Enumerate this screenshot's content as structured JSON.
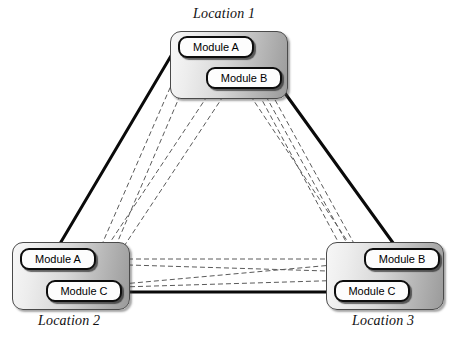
{
  "diagram": {
    "background": "#ffffff",
    "solid_link_color": "#0a0a0a",
    "dashed_link_color": "#5a5a5a",
    "module_fill": "#fdfdfd",
    "module_border": "#0d0d0d",
    "site_border": "#4a4a4a"
  },
  "sites": [
    {
      "id": "location-1",
      "label": "Location 1",
      "label_pos": {
        "x": 193,
        "y": 6
      },
      "box": {
        "x": 170,
        "y": 31,
        "w": 118,
        "h": 68
      },
      "modules": [
        {
          "id": "l1-module-a",
          "label": "Module A",
          "x": 178,
          "y": 36,
          "w": 76,
          "h": 22
        },
        {
          "id": "l1-module-b",
          "label": "Module B",
          "x": 206,
          "y": 67,
          "w": 76,
          "h": 22
        }
      ]
    },
    {
      "id": "location-2",
      "label": "Location 2",
      "label_pos": {
        "x": 38,
        "y": 313
      },
      "box": {
        "x": 12,
        "y": 242,
        "w": 118,
        "h": 68
      },
      "modules": [
        {
          "id": "l2-module-a",
          "label": "Module A",
          "x": 20,
          "y": 248,
          "w": 76,
          "h": 22
        },
        {
          "id": "l2-module-c",
          "label": "Module C",
          "x": 46,
          "y": 280,
          "w": 76,
          "h": 22
        }
      ]
    },
    {
      "id": "location-3",
      "label": "Location 3",
      "label_pos": {
        "x": 352,
        "y": 313
      },
      "box": {
        "x": 326,
        "y": 242,
        "w": 118,
        "h": 68
      },
      "modules": [
        {
          "id": "l3-module-b",
          "label": "Module B",
          "x": 364,
          "y": 248,
          "w": 76,
          "h": 22
        },
        {
          "id": "l3-module-c",
          "label": "Module C",
          "x": 334,
          "y": 280,
          "w": 76,
          "h": 22
        }
      ]
    }
  ],
  "links": {
    "solid": [
      {
        "id": "link-l1a-l2a",
        "from": "l1-module-a",
        "to": "l2-module-a",
        "x1": 178,
        "y1": 44,
        "x2": 58,
        "y2": 247,
        "width": 3
      },
      {
        "id": "link-l1b-l3b",
        "from": "l1-module-b",
        "to": "l3-module-b",
        "x1": 282,
        "y1": 89,
        "x2": 396,
        "y2": 247,
        "width": 3
      },
      {
        "id": "link-l2c-l3c",
        "from": "l2-module-c",
        "to": "l3-module-c",
        "x1": 122,
        "y1": 292,
        "x2": 334,
        "y2": 292,
        "width": 3
      }
    ],
    "dashed": [
      {
        "id": "dash-l1a-l2a",
        "from": "l1-module-a",
        "to": "l2-module-a",
        "x1": 183,
        "y1": 58,
        "x2": 96,
        "y2": 258
      },
      {
        "id": "dash-l1a-l2c",
        "from": "l1-module-a",
        "to": "l2-module-c",
        "x1": 196,
        "y1": 58,
        "x2": 100,
        "y2": 283
      },
      {
        "id": "dash-l1b-l2a",
        "from": "l1-module-b",
        "to": "l2-module-a",
        "x1": 212,
        "y1": 89,
        "x2": 97,
        "y2": 262
      },
      {
        "id": "dash-l1b-l2c",
        "from": "l1-module-b",
        "to": "l2-module-c",
        "x1": 228,
        "y1": 89,
        "x2": 101,
        "y2": 281
      },
      {
        "id": "dash-l1a-l3b",
        "from": "l1-module-a",
        "to": "l3-module-b",
        "x1": 252,
        "y1": 58,
        "x2": 362,
        "y2": 258
      },
      {
        "id": "dash-l1b-l3b",
        "from": "l1-module-b",
        "to": "l3-module-b",
        "x1": 246,
        "y1": 89,
        "x2": 360,
        "y2": 260
      },
      {
        "id": "dash-l1b-l3c",
        "from": "l1-module-b",
        "to": "l3-module-c",
        "x1": 262,
        "y1": 89,
        "x2": 366,
        "y2": 278
      },
      {
        "id": "dash-l1a-l3c",
        "from": "l1-module-a",
        "to": "l3-module-c",
        "x1": 240,
        "y1": 59,
        "x2": 357,
        "y2": 277
      },
      {
        "id": "dash-l2a-l3b",
        "from": "l2-module-a",
        "to": "l3-module-b",
        "x1": 96,
        "y1": 259,
        "x2": 364,
        "y2": 259
      },
      {
        "id": "dash-l2a-l3c",
        "from": "l2-module-a",
        "to": "l3-module-c",
        "x1": 96,
        "y1": 264,
        "x2": 360,
        "y2": 272
      },
      {
        "id": "dash-l2c-l3b",
        "from": "l2-module-c",
        "to": "l3-module-b",
        "x1": 122,
        "y1": 284,
        "x2": 366,
        "y2": 262
      },
      {
        "id": "dash-l2c-l3c",
        "from": "l2-module-c",
        "to": "l3-module-c",
        "x1": 122,
        "y1": 287,
        "x2": 352,
        "y2": 280
      },
      {
        "id": "dash-l1b-in-a",
        "from": "l1-module-a",
        "to": "l1-module-b",
        "x1": 208,
        "y1": 58,
        "x2": 248,
        "y2": 67
      }
    ]
  }
}
